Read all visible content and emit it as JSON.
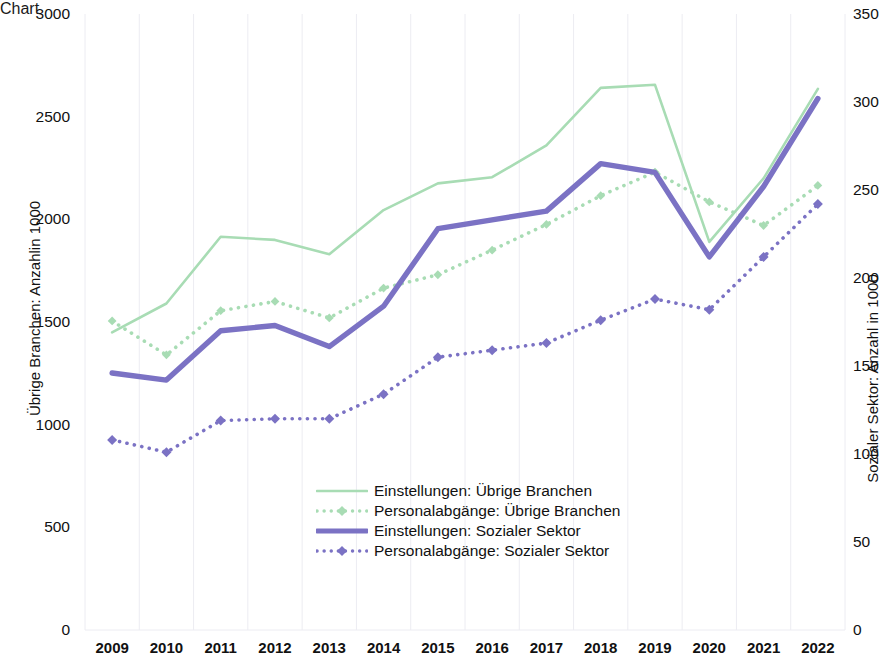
{
  "chart_data": {
    "type": "line",
    "title": "",
    "xlabel": "",
    "categories": [
      "2009",
      "2010",
      "2011",
      "2012",
      "2013",
      "2014",
      "2015",
      "2016",
      "2017",
      "2018",
      "2019",
      "2020",
      "2021",
      "2022"
    ],
    "axes": {
      "left": {
        "label": "Übrige Branchen: Anzahlin 1000",
        "ticks": [
          0,
          500,
          1000,
          1500,
          2000,
          2500,
          3000
        ],
        "ylim": [
          0,
          3000
        ]
      },
      "right": {
        "label": "Sozialer Sektor: Anzahl in 1000",
        "ticks": [
          0,
          50,
          100,
          150,
          200,
          250,
          300,
          350
        ],
        "ylim": [
          0,
          350
        ]
      }
    },
    "grid": true,
    "legend_position": "center",
    "series": [
      {
        "name": "Einstellungen: Übrige Branchen",
        "axis": "left",
        "color": "#a8dcb4",
        "style": "solid",
        "marker": "none",
        "values": [
          1450,
          1590,
          1915,
          1900,
          1830,
          2045,
          2175,
          2205,
          2360,
          2640,
          2655,
          1890,
          2200,
          2635
        ]
      },
      {
        "name": "Personalabgänge: Übrige Branchen",
        "axis": "left",
        "color": "#a8dcb4",
        "style": "dotted",
        "marker": "diamond",
        "values": [
          1505,
          1340,
          1555,
          1600,
          1520,
          1665,
          1730,
          1850,
          1975,
          2115,
          2230,
          2085,
          1970,
          2165
        ]
      },
      {
        "name": "Einstellungen: Sozialer Sektor",
        "axis": "right",
        "color": "#7b72c4",
        "style": "solid",
        "marker": "none",
        "values": [
          146,
          142,
          170,
          173,
          161,
          184,
          228,
          233,
          238,
          265,
          260,
          212,
          252,
          302
        ]
      },
      {
        "name": "Personalabgänge: Sozialer Sektor",
        "axis": "right",
        "color": "#7b72c4",
        "style": "dotted",
        "marker": "diamond",
        "values": [
          108,
          101,
          119,
          120,
          120,
          134,
          155,
          159,
          163,
          176,
          188,
          182,
          212,
          242
        ]
      }
    ]
  },
  "legend": {
    "items": [
      {
        "label": "Einstellungen: Übrige Branchen"
      },
      {
        "label": "Personalabgänge: Übrige Branchen"
      },
      {
        "label": "Einstellungen: Sozialer Sektor"
      },
      {
        "label": "Personalabgänge: Sozialer Sektor"
      }
    ]
  }
}
